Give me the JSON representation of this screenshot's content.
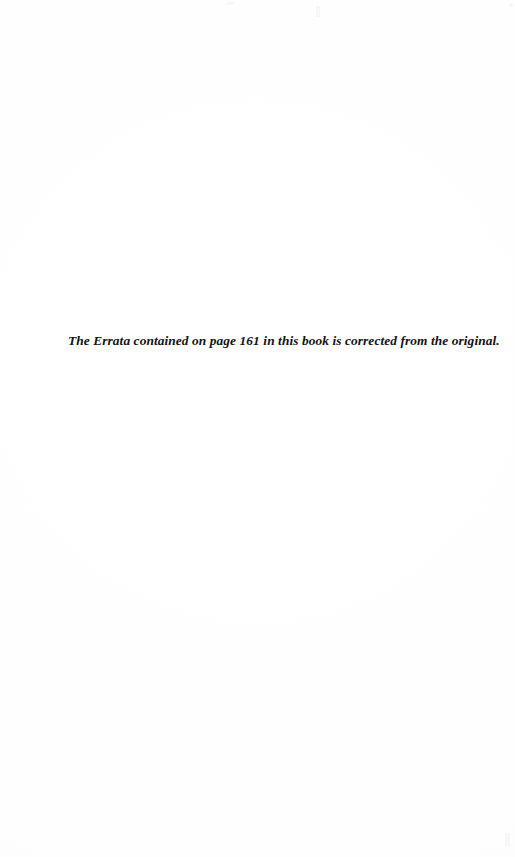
{
  "document": {
    "page_background_color": "#ffffff",
    "text_color": "#141414",
    "body": {
      "errata_note": "The Errata contained on page 161 in this book is corrected from the original."
    }
  }
}
